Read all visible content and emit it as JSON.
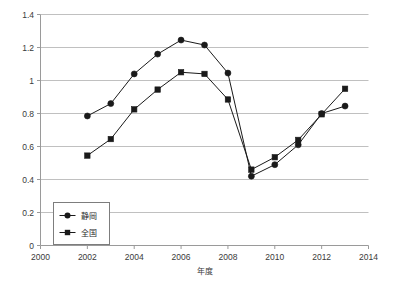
{
  "chart_data": {
    "type": "line",
    "title": "",
    "xlabel": "年度",
    "ylabel": "",
    "x": [
      2002,
      2003,
      2004,
      2005,
      2006,
      2007,
      2008,
      2009,
      2010,
      2011,
      2012,
      2013
    ],
    "categories": [
      "2002",
      "2003",
      "2004",
      "2005",
      "2006",
      "2007",
      "2008",
      "2009",
      "2010",
      "2011",
      "2012",
      "2013"
    ],
    "series": [
      {
        "name": "静岡",
        "marker": "circle",
        "color": "#1a1a1a",
        "values": [
          0.785,
          0.86,
          1.04,
          1.16,
          1.245,
          1.215,
          1.045,
          0.42,
          0.49,
          0.61,
          0.8,
          0.845
        ]
      },
      {
        "name": "全国",
        "marker": "square",
        "color": "#1a1a1a",
        "values": [
          0.545,
          0.645,
          0.825,
          0.945,
          1.05,
          1.04,
          0.885,
          0.46,
          0.535,
          0.64,
          0.795,
          0.95
        ]
      }
    ],
    "xlim": [
      2000,
      2014
    ],
    "ylim": [
      0,
      1.4
    ],
    "xticks": [
      2000,
      2002,
      2004,
      2006,
      2008,
      2010,
      2012,
      2014
    ],
    "xtick_labels": [
      "2000",
      "2002",
      "2004",
      "2006",
      "2008",
      "2010",
      "2012",
      "2014"
    ],
    "yticks": [
      0,
      0.2,
      0.4,
      0.6,
      0.8,
      1,
      1.2,
      1.4
    ],
    "ytick_labels": [
      "0",
      "0.2",
      "0.4",
      "0.6",
      "0.8",
      "1",
      "1.2",
      "1.4"
    ],
    "grid": "horizontal",
    "legend_position": "inside-lower-left",
    "background": "#ffffff",
    "gridline_color": "#b9b9b9",
    "axis_color": "#9a9a9a"
  },
  "legend": {
    "items": [
      {
        "label": "静岡",
        "marker": "circle"
      },
      {
        "label": "全国",
        "marker": "square"
      }
    ]
  }
}
